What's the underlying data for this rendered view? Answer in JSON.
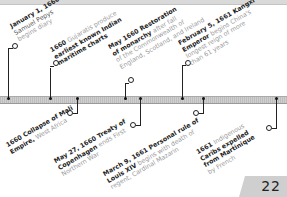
{
  "timeline": {
    "events_above": [
      {
        "bold": "January 1, 1660",
        "lines": [
          "Samuel Pepys",
          "begins diary"
        ],
        "bold_lines": [
          "January 1, 1660",
          "Samuel Pepys"
        ]
      },
      {
        "bold": "1660",
        "text": "Gujaratis produce earliest known Indian maritime charts"
      },
      {
        "bold": "May 1660 Restoration of monarchy",
        "text": "after fall of the Commonwealth of England, Scotland, and Ireland"
      },
      {
        "bold": "February 5, 1661 Kangxi Emperor",
        "text": "begins China's longest reign of more than 61 years"
      }
    ],
    "events_below": [
      {
        "bold": "1660 Collapse of Mali Empire,",
        "text": "West Africa"
      },
      {
        "bold": "May 27, 1660 Treaty of Copenhagen",
        "text": "ends First Northern War"
      },
      {
        "bold": "March 9, 1661 Personal rule of Louis XIV",
        "text": "begins with death of regent, Cardinal Mazarin"
      },
      {
        "bold": "1661",
        "text": "Indigenous",
        "bold2": "Caribs expelled from Martinique",
        "text2": "by French"
      }
    ]
  },
  "labels": {
    "e1_l1": "January 1, 1660",
    "e1_l2": "Samuel Pepys",
    "e1_l3": "begins diary",
    "e2_b": "1660 ",
    "e2_t1": "Gujaratis produce",
    "e2_l2": "earliest known Indian",
    "e2_l3": "maritime charts",
    "e3_b1": "May 1660 Restoration",
    "e3_b2": "of monarchy ",
    "e3_t2": "after fall",
    "e3_l3": "of the Commonwealth of",
    "e3_l4": "England, Scotland, and Ireland",
    "e4_b1": "February 5, 1661 Kangxi",
    "e4_b2": "Emperor ",
    "e4_t2": "begins China's",
    "e4_l3": "longest reign of more",
    "e4_l4": "than 61 years",
    "b1_b1": "1660 Collapse of Mali",
    "b1_b2": "Empire, ",
    "b1_t2": "West Africa",
    "b2_b1": "May 27, 1660 Treaty of",
    "b2_b2": "Copenhagen ",
    "b2_t2": "ends First",
    "b2_l3": "Northern War",
    "b3_b1": "March 9, 1661 Personal rule of",
    "b3_b2": "Louis XIV ",
    "b3_t2": "begins with death of",
    "b3_l3": "regent, Cardinal Mazarin",
    "b4_b1": "1661 ",
    "b4_t1": "Indigenous",
    "b4_b2": "Caribs expelled",
    "b4_b3": "from Martinique",
    "b4_l4": "by French"
  },
  "page_number": "22"
}
